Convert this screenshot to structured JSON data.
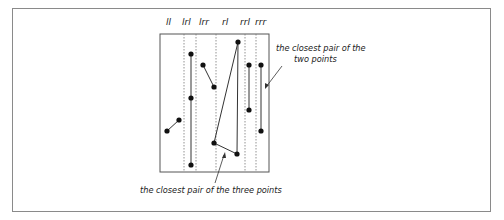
{
  "figure": {
    "strip_labels": [
      "ll",
      "lrl",
      "lrr",
      "rl",
      "rrl",
      "rrr"
    ],
    "annotations": {
      "two_points": [
        "the closest pair of the",
        "two points"
      ],
      "three_points": "the closest pair of the three points"
    },
    "colors": {
      "line": "#333333",
      "point": "#111111",
      "frame": "#8a8a8a",
      "divider": "#777777"
    }
  },
  "points": [
    {
      "id": "ll-a",
      "x": 167,
      "y": 131
    },
    {
      "id": "ll-b",
      "x": 179,
      "y": 120
    },
    {
      "id": "lrl-a",
      "x": 191,
      "y": 54
    },
    {
      "id": "lrl-b",
      "x": 191,
      "y": 98
    },
    {
      "id": "lrl-c",
      "x": 191,
      "y": 165
    },
    {
      "id": "lrr-a",
      "x": 203,
      "y": 65
    },
    {
      "id": "lrr-b",
      "x": 214,
      "y": 87
    },
    {
      "id": "rl-a",
      "x": 214,
      "y": 143
    },
    {
      "id": "rl-b",
      "x": 237,
      "y": 154
    },
    {
      "id": "rrl-top",
      "x": 238,
      "y": 42
    },
    {
      "id": "rrl-a",
      "x": 249,
      "y": 65
    },
    {
      "id": "rrl-b",
      "x": 249,
      "y": 110
    },
    {
      "id": "rrr-a",
      "x": 261,
      "y": 65
    },
    {
      "id": "rrr-b",
      "x": 261,
      "y": 131
    }
  ],
  "segments": [
    [
      "ll-a",
      "ll-b"
    ],
    [
      "lrl-a",
      "lrl-c"
    ],
    [
      "lrr-a",
      "lrr-b"
    ],
    [
      "rrl-top",
      "rl-a"
    ],
    [
      "rrl-top",
      "rl-b"
    ],
    [
      "rl-a",
      "rl-b"
    ],
    [
      "rrl-a",
      "rrl-b"
    ],
    [
      "rrr-a",
      "rrr-b"
    ]
  ]
}
